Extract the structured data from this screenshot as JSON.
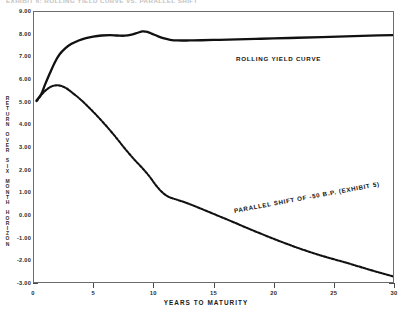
{
  "caption": {
    "text": "EXHIBIT 6: ROLLING YIELD CURVE VS. PARALLEL SHIFT"
  },
  "chart_data": {
    "type": "line",
    "title": "",
    "xlabel": "YEARS TO MATURITY",
    "ylabel": "RETURN OVER SIX MONTH HORIZON",
    "xlim": [
      0,
      30
    ],
    "ylim": [
      -3.0,
      9.0
    ],
    "grid": false,
    "legend_position": "inline-annotation",
    "xticks": [
      0,
      5,
      10,
      15,
      20,
      25,
      30
    ],
    "xtick_labels": [
      "0",
      "5",
      "10",
      "15",
      "20",
      "25",
      "30"
    ],
    "yticks": [
      -3.0,
      -2.0,
      -1.0,
      0.0,
      1.0,
      2.0,
      3.0,
      4.0,
      5.0,
      6.0,
      7.0,
      8.0,
      9.0
    ],
    "ytick_labels": [
      "-3.00",
      "-2.00",
      "-1.00",
      "0.00",
      "1.00",
      "2.00",
      "3.00",
      "4.00",
      "5.00",
      "6.00",
      "7.00",
      "8.00",
      "9.00"
    ],
    "series": [
      {
        "name": "ROLLING YIELD CURVE",
        "style": "solid",
        "color": "#111111",
        "x": [
          0.3,
          0.7,
          1.0,
          1.4,
          1.8,
          2.2,
          2.7,
          3.2,
          3.8,
          4.4,
          5.0,
          5.7,
          6.4,
          7.0,
          7.6,
          8.2,
          8.7,
          9.1,
          9.5,
          9.9,
          10.4,
          10.9,
          11.4,
          12.0,
          13.0,
          14.0,
          15.5,
          17.0,
          18.5,
          20.0,
          22.0,
          24.0,
          26.0,
          28.0,
          30.0
        ],
        "y": [
          5.05,
          5.35,
          5.75,
          6.25,
          6.72,
          7.08,
          7.36,
          7.55,
          7.7,
          7.8,
          7.87,
          7.92,
          7.94,
          7.92,
          7.91,
          7.96,
          8.04,
          8.1,
          8.08,
          7.99,
          7.88,
          7.79,
          7.73,
          7.7,
          7.7,
          7.71,
          7.73,
          7.75,
          7.77,
          7.79,
          7.82,
          7.85,
          7.88,
          7.91,
          7.94
        ]
      },
      {
        "name": "PARALLEL SHIFT OF -50 B.P. (EXHIBIT 5)",
        "style": "dashed",
        "color": "#111111",
        "x": [
          0.3,
          0.7,
          1.1,
          1.5,
          1.9,
          2.3,
          2.8,
          3.3,
          3.9,
          4.5,
          5.1,
          5.7,
          6.3,
          6.9,
          7.5,
          8.0,
          8.5,
          9.0,
          9.4,
          9.8,
          10.2,
          10.7,
          11.2,
          11.8,
          12.5,
          13.5,
          15.0,
          16.5,
          18.0,
          20.0,
          22.0,
          24.0,
          26.0,
          28.0,
          30.0
        ],
        "y": [
          5.02,
          5.3,
          5.52,
          5.66,
          5.72,
          5.7,
          5.58,
          5.38,
          5.12,
          4.82,
          4.5,
          4.16,
          3.8,
          3.42,
          3.02,
          2.7,
          2.4,
          2.12,
          1.88,
          1.62,
          1.32,
          1.02,
          0.82,
          0.7,
          0.58,
          0.38,
          0.05,
          -0.28,
          -0.62,
          -1.05,
          -1.45,
          -1.8,
          -2.1,
          -2.42,
          -2.72
        ]
      }
    ],
    "annotations": [
      {
        "name": "rolling-yield-curve-label",
        "text": "ROLLING YIELD CURVE"
      },
      {
        "name": "parallel-shift-label",
        "text": "PARALLEL SHIFT OF -50 B.P. (EXHIBIT 5)"
      }
    ]
  }
}
